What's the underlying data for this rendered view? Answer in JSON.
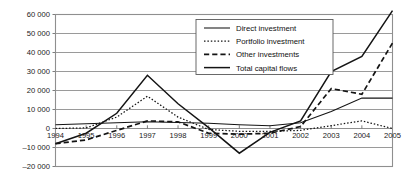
{
  "chart_data": {
    "type": "line",
    "title": "",
    "xlabel": "",
    "ylabel": "",
    "grid": true,
    "legend_position": "top-center-inside",
    "x": [
      1994,
      1995,
      1996,
      1997,
      1998,
      1999,
      2000,
      2001,
      2002,
      2003,
      2004,
      2005
    ],
    "categories": [
      "1994",
      "1995",
      "1996",
      "1997",
      "1998",
      "1999",
      "2000",
      "2001",
      "2002",
      "2003",
      "2004",
      "2005"
    ],
    "ylim": [
      -20000,
      60000
    ],
    "ytick_step": 10000,
    "ytick_labels": [
      "60 000",
      "50 000",
      "40 000",
      "30 000",
      "20 000",
      "10 000",
      "0",
      "–10 000",
      "–20 000"
    ],
    "ytick_values": [
      60000,
      50000,
      40000,
      30000,
      20000,
      10000,
      0,
      -10000,
      -20000
    ],
    "series": [
      {
        "name": "Direct investment",
        "style": "solid-thin",
        "values": [
          2000,
          2500,
          3000,
          3500,
          3200,
          2800,
          2000,
          1500,
          3000,
          9000,
          16000,
          16000
        ]
      },
      {
        "name": "Portfolio investment",
        "style": "dotted",
        "values": [
          0,
          300,
          6000,
          17000,
          6000,
          -500,
          -1500,
          -1500,
          -1000,
          1500,
          4000,
          0
        ]
      },
      {
        "name": "Other investments",
        "style": "dashed",
        "values": [
          -8000,
          -6000,
          -1000,
          4000,
          3500,
          -2500,
          -3000,
          -2500,
          1000,
          21000,
          18000,
          45000
        ]
      },
      {
        "name": "Total capital flows",
        "style": "solid-thick",
        "values": [
          -8000,
          -2500,
          8000,
          28000,
          13000,
          500,
          -13000,
          -2000,
          4000,
          30000,
          38000,
          62000
        ]
      }
    ]
  },
  "legend": {
    "items": [
      {
        "label": "Direct investment"
      },
      {
        "label": "Portfolio investment"
      },
      {
        "label": "Other investments"
      },
      {
        "label": "Total capital flows"
      }
    ]
  },
  "colors": {
    "line": "#141414",
    "grid": "#8f8f8f",
    "text": "#1a1a1a",
    "background": "#ffffff"
  }
}
